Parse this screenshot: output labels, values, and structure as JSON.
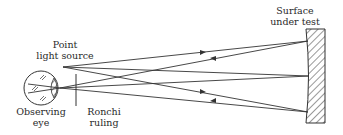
{
  "labels": {
    "point_source": [
      "Point",
      "light source"
    ],
    "surface": [
      "Surface",
      "under test"
    ],
    "eye": [
      "Observing",
      "eye"
    ],
    "ronchi": [
      "Ronchi",
      "ruling"
    ]
  },
  "colors": {
    "line": "#333333",
    "background": "#ffffff"
  },
  "geometry": {
    "point_source": [
      63,
      67
    ],
    "eye_focus": [
      60,
      88
    ],
    "eye_center": [
      41,
      88
    ],
    "eye_radius": 17,
    "ronchi_x": 76,
    "ronchi_y": [
      74,
      106
    ],
    "mirror_box": [
      305,
      28,
      325,
      124
    ]
  }
}
